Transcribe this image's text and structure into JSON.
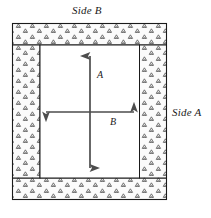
{
  "figure": {
    "type": "engineering-cross-section-diagram",
    "labels": {
      "side_b": "Side B",
      "side_a": "Side A",
      "dimension_vertical": "A",
      "dimension_horizontal": "B"
    },
    "colors": {
      "outline": "#1a1a1a",
      "arrow": "#4d4d4d",
      "hatch_fill": "#fbfbfb",
      "hatch_mark": "#3d3d3d",
      "cavity_fill": "#ffffff",
      "text": "#1a1a1a",
      "background": "#ffffff"
    },
    "geometry": {
      "outer": {
        "x": 12,
        "y": 23,
        "width": 155,
        "height": 177
      },
      "cavity": {
        "x": 40,
        "y": 45,
        "width": 100,
        "height": 133
      },
      "wall_thickness_left": 28,
      "wall_thickness_right": 27,
      "wall_thickness_top": 22,
      "wall_thickness_bottom": 22
    },
    "arrows": {
      "vertical": {
        "x": 90,
        "y_top": 54,
        "y_bottom": 170,
        "label": "A",
        "double_headed": true
      },
      "horizontal": {
        "y": 112,
        "x_left": 44,
        "x_right": 136,
        "label": "B",
        "double_headed": true
      }
    },
    "hatch": {
      "motif": "stipple-triangle",
      "description": "small outlined triangles with dots, staggered grid"
    }
  }
}
